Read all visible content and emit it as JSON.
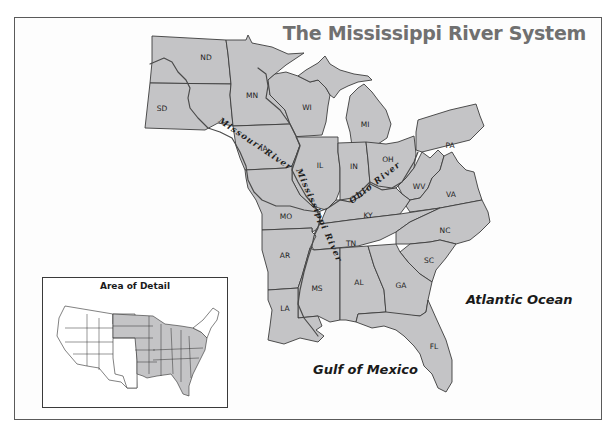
{
  "map": {
    "title": "The Mississippi River System",
    "states": [
      {
        "abbr": "ND",
        "x": 206,
        "y": 60
      },
      {
        "abbr": "SD",
        "x": 162,
        "y": 110
      },
      {
        "abbr": "MN",
        "x": 252,
        "y": 96
      },
      {
        "abbr": "WI",
        "x": 307,
        "y": 108
      },
      {
        "abbr": "MI",
        "x": 365,
        "y": 125
      },
      {
        "abbr": "IA",
        "x": 264,
        "y": 149
      },
      {
        "abbr": "IL",
        "x": 320,
        "y": 166
      },
      {
        "abbr": "IN",
        "x": 355,
        "y": 167
      },
      {
        "abbr": "OH",
        "x": 388,
        "y": 160
      },
      {
        "abbr": "PA",
        "x": 451,
        "y": 148
      },
      {
        "abbr": "WV",
        "x": 419,
        "y": 187
      },
      {
        "abbr": "VA",
        "x": 451,
        "y": 196
      },
      {
        "abbr": "MO",
        "x": 287,
        "y": 219
      },
      {
        "abbr": "KY",
        "x": 368,
        "y": 216
      },
      {
        "abbr": "TN",
        "x": 351,
        "y": 245
      },
      {
        "abbr": "NC",
        "x": 445,
        "y": 232
      },
      {
        "abbr": "SC",
        "x": 429,
        "y": 262
      },
      {
        "abbr": "AR",
        "x": 285,
        "y": 257
      },
      {
        "abbr": "MS",
        "x": 317,
        "y": 290
      },
      {
        "abbr": "AL",
        "x": 359,
        "y": 284
      },
      {
        "abbr": "GA",
        "x": 401,
        "y": 287
      },
      {
        "abbr": "LA",
        "x": 285,
        "y": 310
      },
      {
        "abbr": "FL",
        "x": 434,
        "y": 348
      }
    ],
    "rivers": [
      {
        "name": "Missouri River",
        "label": "Missouri River"
      },
      {
        "name": "Mississippi River",
        "label": "Mississippi River"
      },
      {
        "name": "Ohio River",
        "label": "Ohio River"
      }
    ],
    "water_bodies": {
      "atlantic": "Atlantic Ocean",
      "gulf": "Gulf of Mexico"
    },
    "colors": {
      "land": "#c4c4c6",
      "border": "#3c3c3c",
      "title": "#707070",
      "background": "#fdfdfd"
    }
  },
  "inset": {
    "title": "Area of Detail"
  }
}
